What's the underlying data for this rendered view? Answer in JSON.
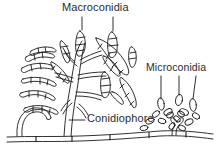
{
  "figure": {
    "background_color": "#ffffff",
    "ink_color": "#1a1a1a",
    "label_color": "#2b2b2b",
    "labels": {
      "macroconidia": "Macroconidia",
      "microconidia": "Microconidia",
      "conidiophore": "Conidiophore"
    },
    "leader_lines": {
      "macroconidia_count": 2,
      "microconidia_count": 3,
      "conidiophore_count": 1
    },
    "structures": {
      "macroconidia_description": "curved multi-septate banana-shaped spores",
      "microconidia_description": "small oval single-celled spores",
      "substrate_description": "horizontal septate hypha"
    }
  }
}
